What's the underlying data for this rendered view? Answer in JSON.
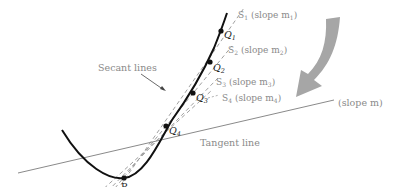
{
  "diagram": {
    "labels": {
      "secant_lines": "Secant lines",
      "tangent_line": "Tangent line",
      "tangent_slope": "(slope m)",
      "point_p": "P"
    },
    "points": [
      {
        "id": "Q1",
        "label": "Q",
        "sub": "1",
        "x": 221,
        "y": 31
      },
      {
        "id": "Q2",
        "label": "Q",
        "sub": "2",
        "x": 210,
        "y": 62
      },
      {
        "id": "Q3",
        "label": "Q",
        "sub": "3",
        "x": 193,
        "y": 93
      },
      {
        "id": "Q4",
        "label": "Q",
        "sub": "4",
        "x": 166,
        "y": 126
      }
    ],
    "secants": [
      {
        "id": "S1",
        "label": "S",
        "sub": "1",
        "slope_text": "(slope m",
        "slope_sub": "1",
        "close": ")"
      },
      {
        "id": "S2",
        "label": "S",
        "sub": "2",
        "slope_text": "(slope m",
        "slope_sub": "2",
        "close": ")"
      },
      {
        "id": "S3",
        "label": "S",
        "sub": "3",
        "slope_text": "(slope m",
        "slope_sub": "3",
        "close": ")"
      },
      {
        "id": "S4",
        "label": "S",
        "sub": "4",
        "slope_text": "(slope m",
        "slope_sub": "4",
        "close": ")"
      }
    ],
    "colors": {
      "curve": "#111111",
      "secant": "#9a9a9a",
      "tangent": "#8a8a8a",
      "arrow": "#a6a6a6",
      "label": "#8a8a8a"
    }
  }
}
